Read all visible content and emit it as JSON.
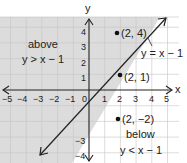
{
  "graph": {
    "type": "linear-inequality",
    "boundary_line_label": "y = x − 1",
    "axis_labels": {
      "x": "x",
      "y": "y"
    },
    "x_ticks": [
      "−5",
      "−4",
      "−3",
      "−2",
      "−1",
      "0",
      "1",
      "2",
      "3",
      "4",
      "5"
    ],
    "y_ticks": [
      "4",
      "3",
      "2",
      "1",
      "−3",
      "−4"
    ],
    "regions": {
      "above": {
        "title": "above",
        "inequality": "y > x − 1",
        "shaded": true,
        "color": "#dcdcdc"
      },
      "below": {
        "title": "below",
        "inequality": "y < x − 1",
        "shaded": false,
        "color": "#ffffff"
      }
    },
    "points": [
      {
        "label": "(2, 4)",
        "x": 2,
        "y": 4
      },
      {
        "label": "(2, 1)",
        "x": 2,
        "y": 1
      },
      {
        "label": "(2, −2)",
        "x": 2,
        "y": -2
      }
    ],
    "colors": {
      "grid": "#bdbdbd",
      "axis": "#222222",
      "shade": "#dcdcdc"
    }
  }
}
